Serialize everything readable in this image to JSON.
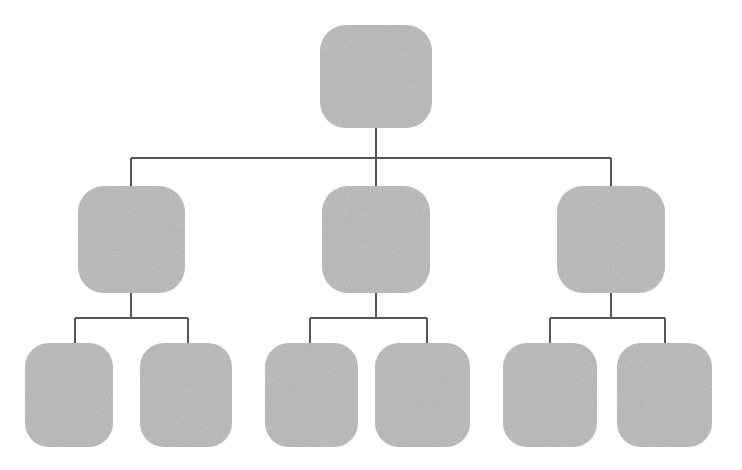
{
  "diagram": {
    "title": "",
    "type": "tree-hierarchy-diagram",
    "orientation": "top-down",
    "levels": 3,
    "background_color": "#ffffff",
    "node_fill_color": "#c2c2c2",
    "connector_color": "#555555",
    "connector_width": 1.6,
    "node_corner_radius": 26,
    "node_texture": "grainy-noise",
    "nodes": [
      {
        "id": "root",
        "label": "",
        "level": 0,
        "x": 320,
        "y": 25,
        "width": 112,
        "height": 103,
        "radius": 26,
        "fill": "#c2c2c2"
      },
      {
        "id": "branch-1",
        "label": "",
        "level": 1,
        "x": 78,
        "y": 186,
        "width": 107,
        "height": 107,
        "radius": 26,
        "fill": "#c2c2c2"
      },
      {
        "id": "branch-2",
        "label": "",
        "level": 1,
        "x": 322,
        "y": 186,
        "width": 108,
        "height": 107,
        "radius": 26,
        "fill": "#c2c2c2"
      },
      {
        "id": "branch-3",
        "label": "",
        "level": 1,
        "x": 557,
        "y": 186,
        "width": 108,
        "height": 107,
        "radius": 26,
        "fill": "#c2c2c2"
      },
      {
        "id": "leaf-1",
        "label": "",
        "level": 2,
        "x": 25,
        "y": 343,
        "width": 88,
        "height": 104,
        "radius": 24,
        "fill": "#c2c2c2"
      },
      {
        "id": "leaf-2",
        "label": "",
        "level": 2,
        "x": 140,
        "y": 343,
        "width": 92,
        "height": 104,
        "radius": 24,
        "fill": "#c2c2c2"
      },
      {
        "id": "leaf-3",
        "label": "",
        "level": 2,
        "x": 265,
        "y": 343,
        "width": 93,
        "height": 104,
        "radius": 24,
        "fill": "#c2c2c2"
      },
      {
        "id": "leaf-4",
        "label": "",
        "level": 2,
        "x": 375,
        "y": 343,
        "width": 95,
        "height": 104,
        "radius": 24,
        "fill": "#c2c2c2"
      },
      {
        "id": "leaf-5",
        "label": "",
        "level": 2,
        "x": 503,
        "y": 343,
        "width": 94,
        "height": 104,
        "radius": 24,
        "fill": "#c2c2c2"
      },
      {
        "id": "leaf-6",
        "label": "",
        "level": 2,
        "x": 617,
        "y": 343,
        "width": 95,
        "height": 104,
        "radius": 24,
        "fill": "#c2c2c2"
      }
    ],
    "connectors": [
      {
        "id": "root-stem",
        "from": "root",
        "kind": "vertical-stem",
        "x": 376,
        "y1": 128,
        "y2": 158
      },
      {
        "id": "level1-bus",
        "kind": "horizontal-bus",
        "y": 158,
        "x1": 131,
        "x2": 611
      },
      {
        "id": "drop-branch-1",
        "to": "branch-1",
        "kind": "vertical-drop",
        "x": 131,
        "y1": 158,
        "y2": 186
      },
      {
        "id": "drop-branch-2",
        "to": "branch-2",
        "kind": "vertical-drop",
        "x": 376,
        "y1": 158,
        "y2": 186
      },
      {
        "id": "drop-branch-3",
        "to": "branch-3",
        "kind": "vertical-drop",
        "x": 611,
        "y1": 158,
        "y2": 186
      },
      {
        "id": "branch-1-stem",
        "from": "branch-1",
        "kind": "vertical-stem",
        "x": 131,
        "y1": 293,
        "y2": 318
      },
      {
        "id": "branch-1-bus",
        "kind": "horizontal-bus",
        "y": 318,
        "x1": 75,
        "x2": 188
      },
      {
        "id": "drop-leaf-1",
        "to": "leaf-1",
        "kind": "vertical-drop",
        "x": 75,
        "y1": 318,
        "y2": 343
      },
      {
        "id": "drop-leaf-2",
        "to": "leaf-2",
        "kind": "vertical-drop",
        "x": 188,
        "y1": 318,
        "y2": 343
      },
      {
        "id": "branch-2-stem",
        "from": "branch-2",
        "kind": "vertical-stem",
        "x": 376,
        "y1": 293,
        "y2": 318
      },
      {
        "id": "branch-2-bus",
        "kind": "horizontal-bus",
        "y": 318,
        "x1": 310,
        "x2": 427
      },
      {
        "id": "drop-leaf-3",
        "to": "leaf-3",
        "kind": "vertical-drop",
        "x": 310,
        "y1": 318,
        "y2": 343
      },
      {
        "id": "drop-leaf-4",
        "to": "leaf-4",
        "kind": "vertical-drop",
        "x": 427,
        "y1": 318,
        "y2": 343
      },
      {
        "id": "branch-3-stem",
        "from": "branch-3",
        "kind": "vertical-stem",
        "x": 611,
        "y1": 293,
        "y2": 318
      },
      {
        "id": "branch-3-bus",
        "kind": "horizontal-bus",
        "y": 318,
        "x1": 550,
        "x2": 665
      },
      {
        "id": "drop-leaf-5",
        "to": "leaf-5",
        "kind": "vertical-drop",
        "x": 550,
        "y1": 318,
        "y2": 343
      },
      {
        "id": "drop-leaf-6",
        "to": "leaf-6",
        "kind": "vertical-drop",
        "x": 665,
        "y1": 318,
        "y2": 343
      }
    ]
  }
}
